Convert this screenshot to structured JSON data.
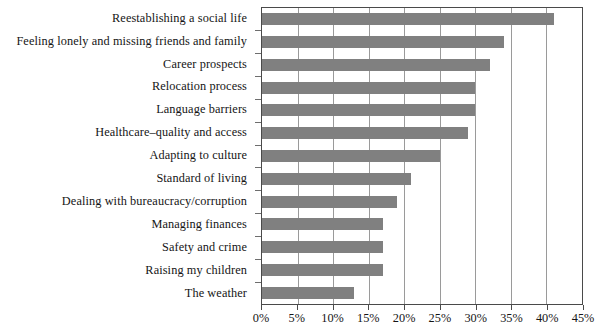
{
  "chart_data": {
    "type": "bar",
    "orientation": "horizontal",
    "title": "",
    "subtitle": "",
    "xlabel": "",
    "ylabel": "",
    "xlim": [
      0,
      45
    ],
    "xtick_step": 5,
    "grid": true,
    "legend": false,
    "bar_color": "#808080",
    "axis_color": "#4a4a4a",
    "gridline_color": "#9a9a9a",
    "value_suffix": "%",
    "categories": [
      "Reestablishing a social life",
      "Feeling lonely and missing friends and family",
      "Career prospects",
      "Relocation process",
      "Language barriers",
      "Healthcare–quality and access",
      "Adapting to culture",
      "Standard of living",
      "Dealing with bureaucracy/corruption",
      "Managing finances",
      "Safety and crime",
      "Raising my children",
      "The weather"
    ],
    "values": [
      41,
      34,
      32,
      30,
      30,
      29,
      25,
      21,
      19,
      17,
      17,
      17,
      13
    ],
    "xticks": [
      0,
      5,
      10,
      15,
      20,
      25,
      30,
      35,
      40,
      45
    ],
    "xtick_labels": [
      "0%",
      "5%",
      "10%",
      "15%",
      "20%",
      "25%",
      "30%",
      "35%",
      "40%",
      "45%"
    ]
  }
}
